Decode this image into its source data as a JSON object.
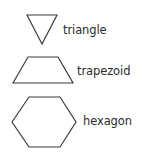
{
  "figure": {
    "background_color": "#ffffff",
    "stroke_color": "#3a3a3a",
    "text_color": "#2b2b2b",
    "width": 142,
    "height": 152
  },
  "shapes": [
    {
      "id": "triangle",
      "label": "triangle",
      "icon_name": "triangle-shape-icon",
      "sides": 3,
      "points": "16,30 1,1 31,1"
    },
    {
      "id": "trapezoid",
      "label": "trapezoid",
      "icon_name": "trapezoid-shape-icon",
      "sides": 4,
      "points": "1,28 16,2 46,2 61,28"
    },
    {
      "id": "hexagon",
      "label": "hexagon",
      "icon_name": "hexagon-shape-icon",
      "sides": 6,
      "points": "1,27 18,2 49,2 65,27 49,52 18,52"
    }
  ]
}
